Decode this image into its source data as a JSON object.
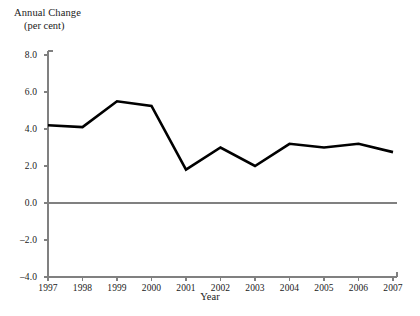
{
  "chart_data": {
    "type": "line",
    "title": "",
    "ylabel_line1": "Annual Change",
    "ylabel_line2": "(per cent)",
    "xlabel": "Year",
    "categories": [
      "1997",
      "1998",
      "1999",
      "2000",
      "2001",
      "2002",
      "2003",
      "2004",
      "2005",
      "2006",
      "2007"
    ],
    "x": [
      1997,
      1998,
      1999,
      2000,
      2001,
      2002,
      2003,
      2004,
      2005,
      2006,
      2007
    ],
    "values": [
      4.2,
      4.1,
      5.5,
      5.25,
      1.8,
      3.0,
      2.0,
      3.2,
      3.0,
      3.2,
      2.75
    ],
    "series": [
      {
        "name": "Annual Change",
        "values": [
          4.2,
          4.1,
          5.5,
          5.25,
          1.8,
          3.0,
          2.0,
          3.2,
          3.0,
          3.2,
          2.75
        ]
      }
    ],
    "ylim": [
      -4.0,
      8.0
    ],
    "ytick_values": [
      8.0,
      6.0,
      4.0,
      2.0,
      0.0,
      -2.0,
      -4.0
    ],
    "ytick_labels": [
      "8.0",
      "6.0",
      "4.0",
      "2.0",
      "0.0",
      "–2.0",
      "–4.0"
    ],
    "xlim": [
      1997,
      2007
    ],
    "grid": false,
    "legend": "none",
    "zero_line": true,
    "line_color": "#000000",
    "axis_color": "#808080",
    "zero_line_color": "#808080",
    "background_color": "#ffffff"
  }
}
